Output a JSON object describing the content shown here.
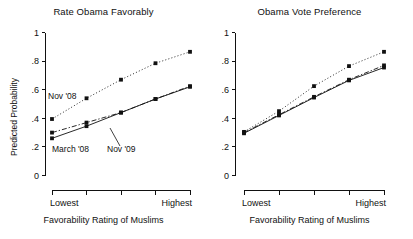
{
  "figure": {
    "ylabel": "Predicted Probability",
    "xlabel": "Favorability Rating of Muslims",
    "y_ticks": [
      "0",
      ".2",
      ".4",
      ".6",
      ".8",
      "1"
    ],
    "x_tick_first": "Lowest",
    "x_tick_last": "Highest"
  },
  "panels": {
    "left": {
      "title": "Rate Obama Favorably",
      "annotations": [
        {
          "name": "nov08",
          "text": "Nov '08"
        },
        {
          "name": "march08",
          "text": "March '08"
        },
        {
          "name": "nov09",
          "text": "Nov '09"
        }
      ]
    },
    "right": {
      "title": "Obama Vote Preference",
      "annotations": []
    }
  },
  "chart_data": [
    {
      "type": "line",
      "title": "Rate Obama Favorably",
      "xlabel": "Favorability Rating of Muslims",
      "ylabel": "Predicted Probability",
      "ylim": [
        0,
        1
      ],
      "yticks": [
        0,
        0.2,
        0.4,
        0.6,
        0.8,
        1
      ],
      "grid": false,
      "legend": "inline-annotations",
      "categories": [
        "Lowest",
        "2",
        "3",
        "4",
        "Highest"
      ],
      "series": [
        {
          "name": "Nov '08",
          "style": "dotted",
          "marker": "square",
          "values": [
            0.395,
            0.54,
            0.67,
            0.785,
            0.865
          ]
        },
        {
          "name": "March '08",
          "style": "solid",
          "marker": "square",
          "values": [
            0.26,
            0.345,
            0.44,
            0.535,
            0.62
          ]
        },
        {
          "name": "Nov '09",
          "style": "dashdot",
          "marker": "square",
          "values": [
            0.3,
            0.37,
            0.44,
            0.535,
            0.625
          ]
        }
      ]
    },
    {
      "type": "line",
      "title": "Obama Vote Preference",
      "xlabel": "Favorability Rating of Muslims",
      "ylabel": "Predicted Probability",
      "ylim": [
        0,
        1
      ],
      "yticks": [
        0,
        0.2,
        0.4,
        0.6,
        0.8,
        1
      ],
      "grid": false,
      "legend": "none",
      "categories": [
        "Lowest",
        "2",
        "3",
        "4",
        "Highest"
      ],
      "series": [
        {
          "name": "Nov '08",
          "style": "dotted",
          "marker": "square",
          "values": [
            0.305,
            0.45,
            0.625,
            0.765,
            0.865
          ]
        },
        {
          "name": "March '08",
          "style": "solid",
          "marker": "square",
          "values": [
            0.295,
            0.42,
            0.545,
            0.665,
            0.755
          ]
        },
        {
          "name": "Nov '09",
          "style": "dashdot",
          "marker": "square",
          "values": [
            0.3,
            0.425,
            0.55,
            0.67,
            0.77
          ]
        }
      ]
    }
  ],
  "colors": {
    "axis": "#111111",
    "series": "#111111",
    "background": "#ffffff"
  }
}
